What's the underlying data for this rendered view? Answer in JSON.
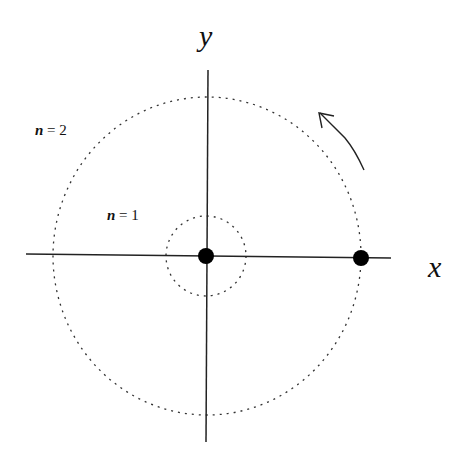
{
  "diagram": {
    "axes": {
      "x_label": "x",
      "y_label": "y"
    },
    "orbits": [
      {
        "label": "n = 1",
        "n": "n",
        "eq": " = 1"
      },
      {
        "label": "n = 2",
        "n": "n",
        "eq": " = 2"
      }
    ],
    "points": [
      {
        "name": "origin-dot"
      },
      {
        "name": "orbit-dot"
      }
    ],
    "arrow": {
      "direction": "counterclockwise"
    },
    "colors": {
      "stroke": "#222222",
      "dot": "#000000",
      "background": "#ffffff"
    }
  }
}
